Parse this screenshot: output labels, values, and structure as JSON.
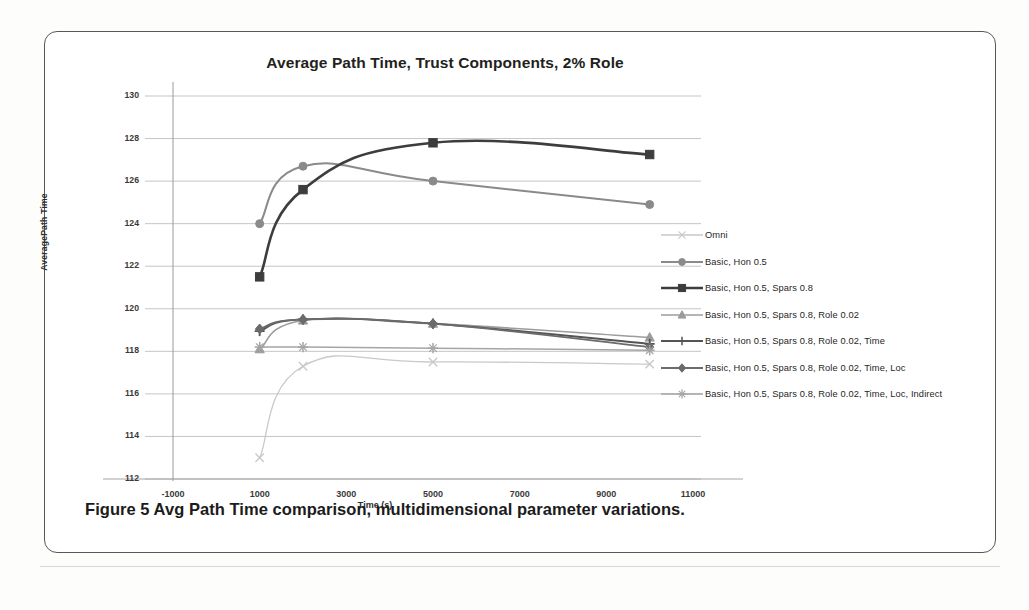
{
  "figure": {
    "caption": "Figure 5 Avg Path Time comparison, multidimensional parameter variations."
  },
  "chart_data": {
    "type": "line",
    "title": "Average Path Time, Trust Components, 2% Role",
    "xlabel": "Time (s)",
    "ylabel": "AveragePath Time",
    "xlim": [
      -1000,
      11000
    ],
    "ylim": [
      112,
      130
    ],
    "xticks": [
      -1000,
      1000,
      3000,
      5000,
      7000,
      9000,
      11000
    ],
    "yticks": [
      112,
      114,
      116,
      118,
      120,
      122,
      124,
      126,
      128,
      130
    ],
    "grid": true,
    "legend_position": "right",
    "x": [
      1000,
      2000,
      5000,
      10000
    ],
    "series": [
      {
        "name": "Omni",
        "marker": "x",
        "color": "#c9c9c9",
        "values": [
          113.0,
          117.3,
          117.5,
          117.4
        ]
      },
      {
        "name": "Basic, Hon 0.5",
        "marker": "circle",
        "color": "#8a8a8a",
        "values": [
          124.0,
          126.7,
          126.0,
          124.9
        ]
      },
      {
        "name": "Basic, Hon 0.5, Spars 0.8",
        "marker": "square",
        "color": "#3d3d3d",
        "values": [
          121.5,
          125.6,
          127.8,
          127.25
        ]
      },
      {
        "name": "Basic, Hon 0.5, Spars 0.8, Role 0.02",
        "marker": "triangle",
        "color": "#9c9c9c",
        "values": [
          118.1,
          119.45,
          119.3,
          118.65
        ]
      },
      {
        "name": "Basic, Hon 0.5, Spars 0.8, Role 0.02, Time",
        "marker": "plus",
        "color": "#555555",
        "values": [
          118.95,
          119.5,
          119.3,
          118.35
        ]
      },
      {
        "name": "Basic, Hon 0.5, Spars 0.8, Role 0.02, Time, Loc",
        "marker": "diamond",
        "color": "#6b6b6b",
        "values": [
          119.05,
          119.5,
          119.3,
          118.2
        ]
      },
      {
        "name": "Basic, Hon 0.5, Spars 0.8, Role 0.02, Time, Loc, Indirect",
        "marker": "star",
        "color": "#a5a5a5",
        "values": [
          118.2,
          118.2,
          118.15,
          118.05
        ]
      }
    ]
  }
}
